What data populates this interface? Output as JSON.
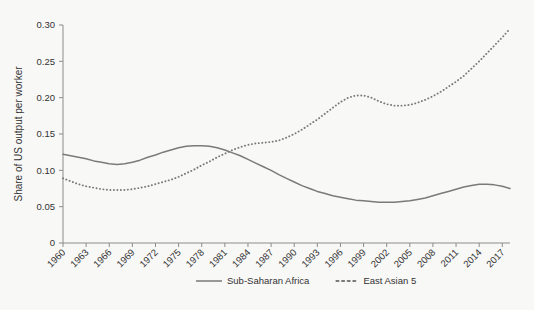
{
  "chart_data": {
    "type": "line",
    "title": "",
    "xlabel": "",
    "ylabel": "Share of US output per worker",
    "ylim": [
      0,
      0.3
    ],
    "yticks": [
      0,
      0.05,
      0.1,
      0.15,
      0.2,
      0.25,
      0.3
    ],
    "ytick_labels": [
      "0",
      "0.05",
      "0.10",
      "0.15",
      "0.20",
      "0.25",
      "0.30"
    ],
    "xlim": [
      1960,
      2018
    ],
    "xticks": [
      1960,
      1963,
      1966,
      1969,
      1972,
      1975,
      1978,
      1981,
      1984,
      1987,
      1990,
      1993,
      1996,
      1999,
      2002,
      2005,
      2008,
      2011,
      2014,
      2017
    ],
    "xtick_labels": [
      "1960",
      "1963",
      "1966",
      "1969",
      "1972",
      "1975",
      "1978",
      "1981",
      "1984",
      "1987",
      "1990",
      "1993",
      "1996",
      "1999",
      "2002",
      "2005",
      "2008",
      "2011",
      "2014",
      "2017"
    ],
    "grid": false,
    "legend_position": "bottom",
    "x": [
      1960,
      1961,
      1962,
      1963,
      1964,
      1965,
      1966,
      1967,
      1968,
      1969,
      1970,
      1971,
      1972,
      1973,
      1974,
      1975,
      1976,
      1977,
      1978,
      1979,
      1980,
      1981,
      1982,
      1983,
      1984,
      1985,
      1986,
      1987,
      1988,
      1989,
      1990,
      1991,
      1992,
      1993,
      1994,
      1995,
      1996,
      1997,
      1998,
      1999,
      2000,
      2001,
      2002,
      2003,
      2004,
      2005,
      2006,
      2007,
      2008,
      2009,
      2010,
      2011,
      2012,
      2013,
      2014,
      2015,
      2016,
      2017,
      2018
    ],
    "series": [
      {
        "name": "Sub-Saharan Africa",
        "style": "solid",
        "color": "#7a7a7a",
        "values": [
          0.122,
          0.12,
          0.118,
          0.116,
          0.113,
          0.111,
          0.109,
          0.108,
          0.109,
          0.111,
          0.114,
          0.118,
          0.121,
          0.125,
          0.128,
          0.131,
          0.133,
          0.134,
          0.134,
          0.133,
          0.131,
          0.128,
          0.124,
          0.12,
          0.115,
          0.11,
          0.105,
          0.1,
          0.094,
          0.089,
          0.084,
          0.079,
          0.075,
          0.071,
          0.068,
          0.065,
          0.063,
          0.061,
          0.059,
          0.058,
          0.057,
          0.056,
          0.056,
          0.056,
          0.057,
          0.058,
          0.06,
          0.062,
          0.065,
          0.068,
          0.071,
          0.074,
          0.077,
          0.079,
          0.081,
          0.081,
          0.08,
          0.078,
          0.075
        ]
      },
      {
        "name": "East Asian 5",
        "style": "dotted",
        "color": "#7a7a7a",
        "values": [
          0.089,
          0.085,
          0.081,
          0.078,
          0.076,
          0.074,
          0.073,
          0.073,
          0.073,
          0.074,
          0.076,
          0.078,
          0.081,
          0.084,
          0.087,
          0.091,
          0.096,
          0.101,
          0.107,
          0.112,
          0.118,
          0.123,
          0.128,
          0.132,
          0.135,
          0.137,
          0.138,
          0.139,
          0.141,
          0.145,
          0.15,
          0.156,
          0.163,
          0.17,
          0.178,
          0.186,
          0.194,
          0.2,
          0.203,
          0.203,
          0.2,
          0.195,
          0.191,
          0.189,
          0.189,
          0.19,
          0.193,
          0.197,
          0.202,
          0.208,
          0.215,
          0.222,
          0.23,
          0.24,
          0.25,
          0.261,
          0.272,
          0.283,
          0.295
        ]
      }
    ]
  },
  "legend": {
    "items": [
      {
        "label": "Sub-Saharan Africa",
        "style": "solid"
      },
      {
        "label": "East Asian 5",
        "style": "dotted"
      }
    ]
  }
}
